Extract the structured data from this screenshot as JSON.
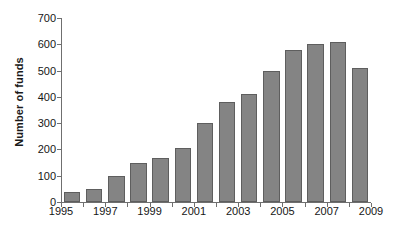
{
  "chart_data": {
    "type": "bar",
    "title": "",
    "xlabel": "",
    "ylabel": "Number of funds",
    "ylim": [
      0,
      700
    ],
    "ytick_values": [
      0,
      100,
      200,
      300,
      400,
      500,
      600,
      700
    ],
    "ytick_labels": [
      "0",
      "100",
      "200",
      "300",
      "400",
      "500",
      "600",
      "700"
    ],
    "xlim": [
      1995,
      2009
    ],
    "xtick_values": [
      1995,
      1996,
      1997,
      1998,
      1999,
      2000,
      2001,
      2002,
      2003,
      2004,
      2005,
      2006,
      2007,
      2008,
      2009
    ],
    "xtick_labels": [
      "1995",
      "",
      "1997",
      "",
      "1999",
      "",
      "2001",
      "",
      "2003",
      "",
      "2005",
      "",
      "2007",
      "",
      "2009"
    ],
    "labeled_xticks": [
      "1995",
      "1997",
      "1999",
      "2001",
      "2003",
      "2005",
      "2007",
      "2009"
    ],
    "grid": false,
    "legend": null,
    "categories": [
      "1995",
      "1996",
      "1997",
      "1998",
      "1999",
      "2000",
      "2001",
      "2002",
      "2003",
      "2004",
      "2005",
      "2006",
      "2007",
      "2008"
    ],
    "values": [
      40,
      50,
      100,
      150,
      168,
      207,
      300,
      380,
      410,
      500,
      580,
      600,
      610,
      510
    ],
    "bar_color": "#848484",
    "bar_edge_color": "#5e5e5e",
    "axis_color": "#6f6f6f",
    "background_color": "#ffffff",
    "text_color": "#161616"
  }
}
